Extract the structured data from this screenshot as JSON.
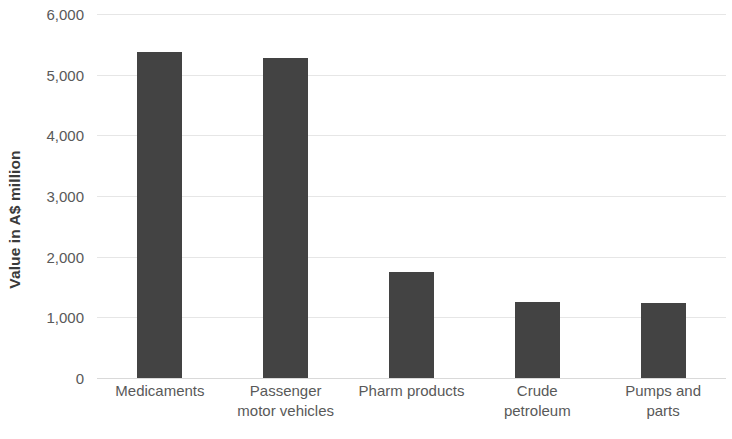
{
  "chart_data": {
    "type": "bar",
    "title": "",
    "xlabel": "",
    "ylabel": "Value in A$ million",
    "categories": [
      "Medicaments",
      "Passenger\nmotor vehicles",
      "Pharm products",
      "Crude\npetroleum",
      "Pumps and\nparts"
    ],
    "values": [
      5370,
      5270,
      1740,
      1250,
      1240
    ],
    "ylim": [
      0,
      6000
    ],
    "ytick_values": [
      0,
      1000,
      2000,
      3000,
      4000,
      5000,
      6000
    ],
    "ytick_labels": [
      "0",
      "1,000",
      "2,000",
      "3,000",
      "4,000",
      "5,000",
      "6,000"
    ],
    "grid": true,
    "legend": false,
    "bar_color": "#434343",
    "gridline_color": "#e6e6e6",
    "background_color": "#ffffff",
    "tick_label_color": "#595959",
    "axis_title_color": "#3a3a3a"
  }
}
